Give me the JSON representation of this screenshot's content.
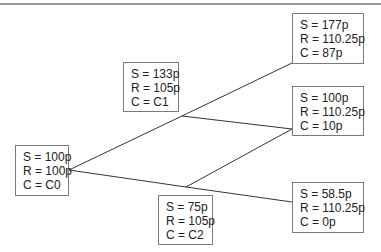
{
  "nodes": {
    "root": {
      "s": "S = 100p",
      "r": "R = 100p",
      "c": "C = C0"
    },
    "up": {
      "s": "S = 133p",
      "r": "R = 105p",
      "c": "C = C1"
    },
    "down": {
      "s": "S = 75p",
      "r": "R = 105p",
      "c": "C = C2"
    },
    "uu": {
      "s": "S = 177p",
      "r": "R = 110.25p",
      "c": "C = 87p"
    },
    "ud": {
      "s": "S = 100p",
      "r": "R = 110.25p",
      "c": "C = 10p"
    },
    "dd": {
      "s": "S = 58.5p",
      "r": "R = 110.25p",
      "c": "C = 0p"
    }
  },
  "colors": {
    "line": "#333333",
    "border": "#7a7a7a",
    "top_rule": "#9a9a9a"
  }
}
